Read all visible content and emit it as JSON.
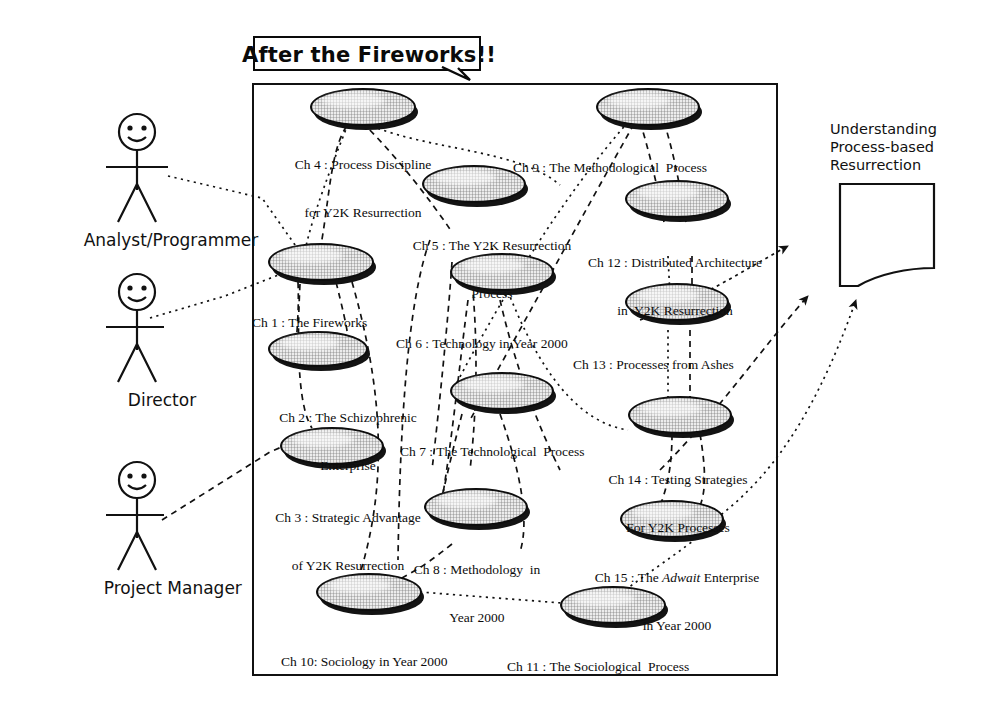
{
  "diagram": {
    "title": "After the Fireworks!!",
    "type": "uml-use-case-diagram"
  },
  "actors": [
    {
      "id": "analyst",
      "label": "Analyst/Programmer"
    },
    {
      "id": "director",
      "label": "Director"
    },
    {
      "id": "manager",
      "label": "Project Manager"
    }
  ],
  "note": {
    "line1": "Understanding",
    "line2": "Process-based",
    "line3": "Resurrection"
  },
  "use_cases": [
    {
      "id": "ch4",
      "line1": "Ch 4 : Process Discipline",
      "line2": "for Y2K Resurrection"
    },
    {
      "id": "ch1",
      "line1": "Ch 1 : The Fireworks",
      "line2": ""
    },
    {
      "id": "ch2",
      "line1": "Ch 2 : The Schizophrenic",
      "line2": "Enterprise"
    },
    {
      "id": "ch3",
      "line1": "Ch 3 : Strategic Advantage",
      "line2": "of Y2K Resurrection"
    },
    {
      "id": "ch5",
      "line1": "Ch 5 : The Y2K Resurrection",
      "line2": "Process"
    },
    {
      "id": "ch6",
      "line1": "Ch 6 : Technology in Year 2000",
      "line2": ""
    },
    {
      "id": "ch7",
      "line1": "Ch 7 : The Technological  Process",
      "line2": ""
    },
    {
      "id": "ch8",
      "line1": "Ch 8 : Methodology  in",
      "line2": "Year 2000"
    },
    {
      "id": "ch9",
      "line1": "Ch 9 : The Methodological  Process",
      "line2": ""
    },
    {
      "id": "ch12",
      "line1": "Ch 12 : Distributed Architecture",
      "line2": "in  Y2K Resurrection"
    },
    {
      "id": "ch13",
      "line1": "Ch 13 : Processes from Ashes",
      "line2": ""
    },
    {
      "id": "ch14",
      "line1": "Ch 14 : Testing Strategies",
      "line2": "For Y2K Processes"
    },
    {
      "id": "ch15",
      "line1": "Ch 15 : The ",
      "line1_italic": "Adwait",
      "line1_tail": " Enterprise",
      "line2": "in Year 2000"
    },
    {
      "id": "ch10",
      "line1": "Ch 10: Sociology in Year 2000",
      "line2": ""
    },
    {
      "id": "ch11",
      "line1": "Ch 11 : The Sociological  Process",
      "line2": ""
    }
  ],
  "colors": {
    "stroke": "#0d0d0d",
    "ellipse_fill": "#ececec",
    "background": "#ffffff"
  }
}
